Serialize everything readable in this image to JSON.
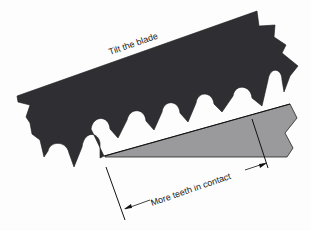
{
  "diagram": {
    "labels": {
      "top": "Tilt the blade",
      "dimension": "More teeth in contact"
    },
    "colors": {
      "blade": "#2f2f33",
      "workpiece": "#9a9a9c",
      "line": "#111111",
      "background": "#fdfdfd"
    }
  }
}
